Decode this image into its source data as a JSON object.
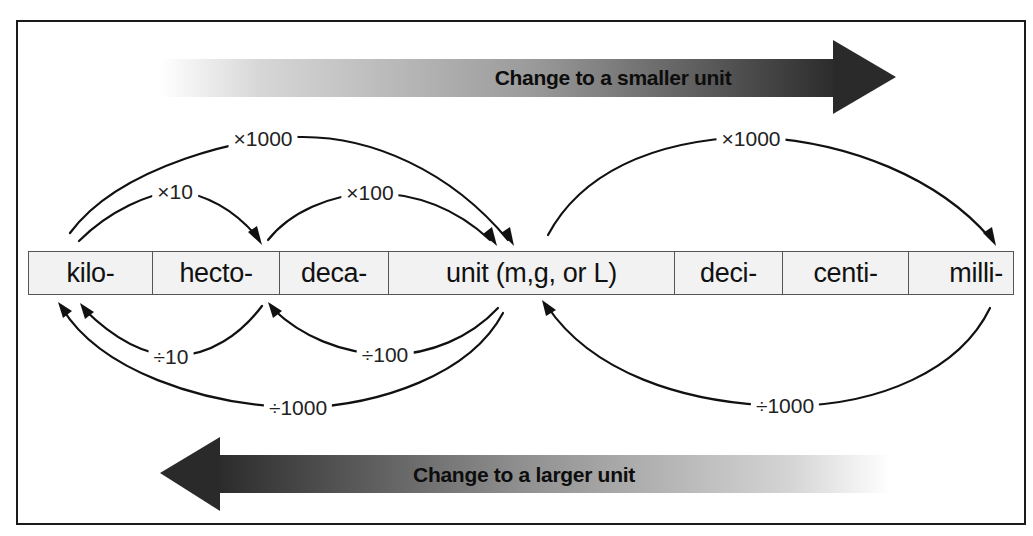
{
  "diagram": {
    "top_arrow": {
      "label": "Change to a smaller unit",
      "direction": "right"
    },
    "bottom_arrow": {
      "label": "Change to a larger unit",
      "direction": "left"
    },
    "units": [
      {
        "label": "kilo-"
      },
      {
        "label": "hecto-"
      },
      {
        "label": "deca-"
      },
      {
        "label": "unit (m,g, or L)"
      },
      {
        "label": "deci-"
      },
      {
        "label": "centi-"
      },
      {
        "label": "milli-"
      }
    ],
    "multiply_arcs": [
      {
        "label": "×10",
        "from": "kilo-",
        "to": "hecto-"
      },
      {
        "label": "×100",
        "from": "hecto-",
        "to": "unit (m,g, or L)"
      },
      {
        "label": "×1000",
        "from": "kilo-",
        "to": "unit (m,g, or L)"
      },
      {
        "label": "×1000",
        "from": "unit (m,g, or L)",
        "to": "milli-"
      }
    ],
    "divide_arcs": [
      {
        "label": "÷10",
        "from": "hecto-",
        "to": "kilo-"
      },
      {
        "label": "÷100",
        "from": "unit (m,g, or L)",
        "to": "hecto-"
      },
      {
        "label": "÷1000",
        "from": "unit (m,g, or L)",
        "to": "kilo-"
      },
      {
        "label": "÷1000",
        "from": "milli-",
        "to": "unit (m,g, or L)"
      }
    ]
  },
  "colors": {
    "frame": "#1a1a1a",
    "arrow_dark": "#2a2a2a",
    "cell_fill": "#f2f2f2",
    "cell_border": "#555555"
  }
}
